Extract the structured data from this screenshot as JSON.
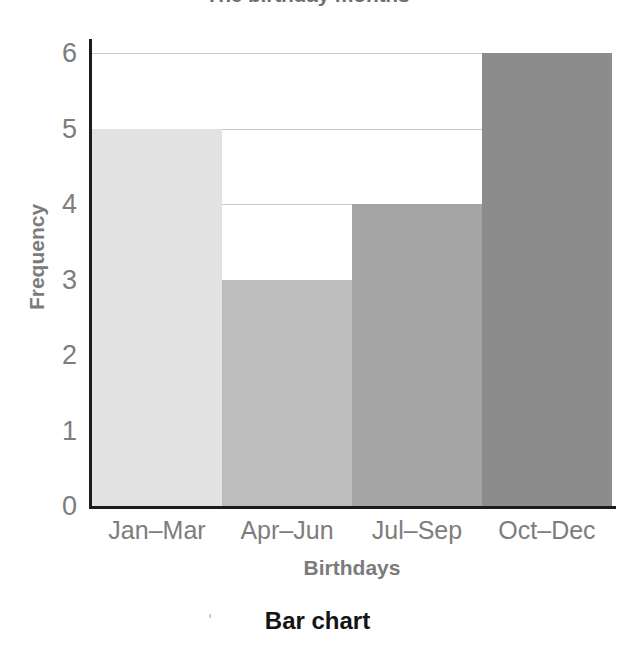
{
  "chart_data": {
    "type": "bar",
    "title": "The birthday months",
    "caption": "Bar chart",
    "xlabel": "Birthdays",
    "ylabel": "Frequency",
    "categories": [
      "Jan–Mar",
      "Apr–Jun",
      "Jul–Sep",
      "Oct–Dec"
    ],
    "values": [
      5,
      3,
      4,
      6
    ],
    "ylim": [
      0,
      6
    ],
    "yticks": [
      6,
      5,
      4,
      3,
      2,
      1,
      0
    ],
    "ytick_labels": [
      "6",
      "5",
      "4",
      "3",
      "2",
      "1",
      "0"
    ],
    "grid": true,
    "gridlines_at": [
      6,
      5,
      4
    ],
    "legend": null,
    "bar_gap": 0,
    "bar_colors": [
      "#e2e2e2",
      "#bdbdbd",
      "#a5a5a5",
      "#8c8c8c"
    ],
    "colors": {
      "axis": "#1b1b1b",
      "gridline": "#c9c9c9",
      "tick_label": "#7d7d7d",
      "axis_title": "#7b7b7b",
      "chart_title": "#6f6f6f",
      "caption": "#141414",
      "background": "#ffffff"
    }
  }
}
